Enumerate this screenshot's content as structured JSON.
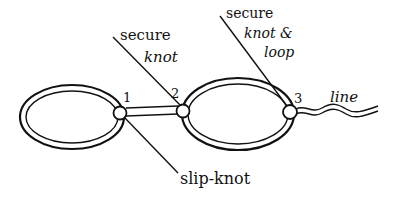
{
  "diagram": {
    "type": "rope-knot-loop-diagram",
    "knots": [
      {
        "id": 1,
        "label": "1",
        "x": 120,
        "y": 113
      },
      {
        "id": 2,
        "label": "2",
        "x": 183,
        "y": 111
      },
      {
        "id": 3,
        "label": "3",
        "x": 290,
        "y": 112
      }
    ],
    "annotations": {
      "secure_knot": {
        "line1": "secure",
        "line2": "knot"
      },
      "secure_knot_loop": {
        "line1": "secure",
        "line2": "knot &",
        "line3": "loop"
      },
      "slip_knot": "slip-knot",
      "line": "line"
    },
    "colors": {
      "ink": "#111111",
      "background": "#ffffff"
    }
  }
}
